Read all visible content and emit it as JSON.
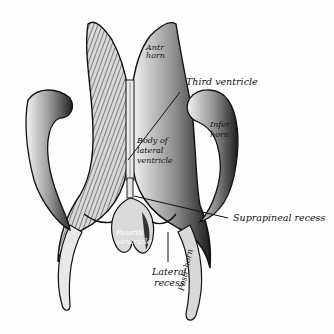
{
  "figure": {
    "labels": {
      "ant_horn": [
        "Antr",
        "horn"
      ],
      "third_ventricle": "Third ventricle",
      "body_lateral_ventricle": [
        "Body of",
        "lateral",
        "ventricle"
      ],
      "infer_horn": [
        "Infer",
        "horn"
      ],
      "suprapineal_recess": "Suprapineal recess",
      "fourth_ventricle": [
        "Fourth",
        "ventricle"
      ],
      "lateral_recess": [
        "Lateral",
        "recess"
      ],
      "post_horn": "Postr horn"
    },
    "colors": {
      "ink": "#111111",
      "shade_dark": "#2a2a2a",
      "shade_mid": "#8a8a8a",
      "paper": "#fefefe"
    }
  }
}
